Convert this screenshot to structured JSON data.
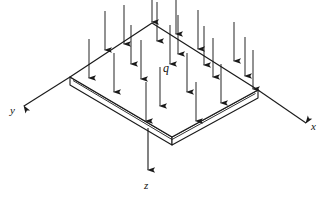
{
  "figure": {
    "kind": "engineering-diagram",
    "background_color": "#ffffff",
    "line_color": "#1a1a1a",
    "arrow_color": "#1a1a1a"
  },
  "labels": {
    "x_axis": "x",
    "y_axis": "y",
    "z_axis": "z",
    "load": "q"
  },
  "label_positions": {
    "x_axis": {
      "x": 311,
      "y": 130
    },
    "y_axis": {
      "x": 10,
      "y": 114
    },
    "z_axis": {
      "x": 144,
      "y": 189
    },
    "load": {
      "x": 163,
      "y": 72
    }
  },
  "plate": {
    "top_face": [
      {
        "x": 152,
        "y": 23
      },
      {
        "x": 258,
        "y": 90
      },
      {
        "x": 172,
        "y": 137
      },
      {
        "x": 70,
        "y": 77
      }
    ],
    "thickness_px": 8,
    "bevel_inset_px": 2.5,
    "fill": "#ffffff",
    "stroke_width": 1.1
  },
  "axes": [
    {
      "name": "x-axis",
      "from": {
        "x": 258,
        "y": 90
      },
      "to": {
        "x": 309,
        "y": 125
      },
      "arrowhead": "end"
    },
    {
      "name": "y-axis",
      "from": {
        "x": 70,
        "y": 77
      },
      "to": {
        "x": 21,
        "y": 108
      },
      "arrowhead": "end"
    },
    {
      "name": "z-axis",
      "from": {
        "x": 148,
        "y": 130
      },
      "to": {
        "x": 148,
        "y": 174
      },
      "arrowhead": "end"
    }
  ],
  "load_arrows": {
    "description": "Uniformly distributed downward load arrows over the plate top face",
    "direction": "down",
    "length_px": 40,
    "count": 22,
    "tips": [
      {
        "x": 152,
        "y": 23
      },
      {
        "x": 105,
        "y": 51
      },
      {
        "x": 131,
        "y": 65
      },
      {
        "x": 89,
        "y": 79
      },
      {
        "x": 114,
        "y": 93
      },
      {
        "x": 198,
        "y": 50
      },
      {
        "x": 170,
        "y": 65
      },
      {
        "x": 213,
        "y": 78
      },
      {
        "x": 187,
        "y": 93
      },
      {
        "x": 245,
        "y": 77
      },
      {
        "x": 221,
        "y": 104
      },
      {
        "x": 160,
        "y": 107
      },
      {
        "x": 141,
        "y": 80
      },
      {
        "x": 157,
        "y": 42
      },
      {
        "x": 204,
        "y": 66
      },
      {
        "x": 124,
        "y": 45
      },
      {
        "x": 176,
        "y": 35
      },
      {
        "x": 234,
        "y": 62
      },
      {
        "x": 253,
        "y": 90
      },
      {
        "x": 196,
        "y": 122
      },
      {
        "x": 178,
        "y": 55
      },
      {
        "x": 146,
        "y": 122
      }
    ]
  }
}
